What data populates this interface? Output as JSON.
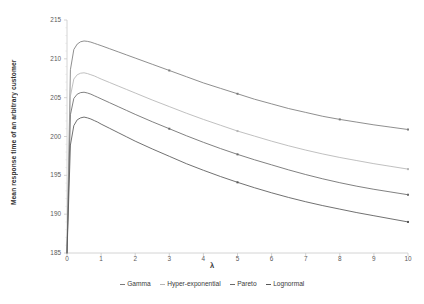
{
  "chart_data": {
    "type": "line",
    "title": "",
    "xlabel": "λ",
    "ylabel": "Mean response time of an arbitrary customer",
    "xlim": [
      0,
      10
    ],
    "ylim": [
      185,
      215
    ],
    "xticks": [
      "0",
      "1",
      "2",
      "3",
      "4",
      "5",
      "6",
      "7",
      "8",
      "9",
      "10"
    ],
    "yticks": [
      "185",
      "190",
      "195",
      "200",
      "205",
      "210",
      "215"
    ],
    "grid": false,
    "legend_position": "bottom",
    "x": [
      0,
      0.1,
      0.2,
      0.3,
      0.4,
      0.5,
      0.6,
      0.7,
      0.8,
      0.9,
      1.0,
      1.25,
      1.5,
      1.75,
      2.0,
      2.5,
      3.0,
      3.5,
      4.0,
      4.5,
      5.0,
      5.5,
      6.0,
      6.5,
      7.0,
      7.5,
      8.0,
      8.5,
      9.0,
      9.5,
      10.0
    ],
    "series": [
      {
        "name": "Gamma",
        "color": "#7b7b7b",
        "values": [
          185.0,
          208.6,
          211.2,
          211.9,
          212.2,
          212.3,
          212.25,
          212.15,
          212.0,
          211.85,
          211.7,
          211.3,
          210.9,
          210.5,
          210.1,
          209.3,
          208.5,
          207.7,
          206.9,
          206.2,
          205.5,
          204.8,
          204.2,
          203.6,
          203.1,
          202.6,
          202.2,
          201.85,
          201.5,
          201.2,
          200.9
        ]
      },
      {
        "name": "Hyper-exponential",
        "color": "#b5b5b5",
        "values": [
          185.0,
          205.2,
          207.4,
          207.95,
          208.15,
          208.2,
          208.1,
          207.95,
          207.8,
          207.6,
          207.4,
          206.95,
          206.5,
          206.05,
          205.6,
          204.7,
          203.85,
          203.0,
          202.2,
          201.45,
          200.7,
          200.05,
          199.4,
          198.8,
          198.25,
          197.75,
          197.3,
          196.9,
          196.5,
          196.15,
          195.8
        ]
      },
      {
        "name": "Pareto",
        "color": "#6a6a6a",
        "values": [
          185.0,
          202.8,
          204.9,
          205.45,
          205.65,
          205.7,
          205.6,
          205.45,
          205.25,
          205.05,
          204.85,
          204.35,
          203.85,
          203.35,
          202.85,
          201.9,
          201.0,
          200.1,
          199.25,
          198.45,
          197.7,
          197.0,
          196.35,
          195.7,
          195.1,
          194.55,
          194.05,
          193.6,
          193.2,
          192.85,
          192.5
        ]
      },
      {
        "name": "Lognormal",
        "color": "#575757",
        "values": [
          185.0,
          198.9,
          201.4,
          202.15,
          202.4,
          202.5,
          202.4,
          202.25,
          202.05,
          201.85,
          201.6,
          201.05,
          200.5,
          199.95,
          199.4,
          198.4,
          197.45,
          196.5,
          195.65,
          194.85,
          194.1,
          193.4,
          192.75,
          192.15,
          191.6,
          191.1,
          190.65,
          190.2,
          189.8,
          189.4,
          189.0
        ]
      }
    ],
    "markers": {
      "Gamma": [
        [
          3,
          208.5
        ],
        [
          5,
          205.5
        ],
        [
          8,
          202.2
        ],
        [
          10,
          200.9
        ]
      ],
      "Hyper-exponential": [
        [
          5,
          200.7
        ],
        [
          10,
          195.8
        ]
      ],
      "Pareto": [
        [
          3,
          201.0
        ],
        [
          5,
          197.7
        ],
        [
          10,
          192.5
        ]
      ],
      "Lognormal": [
        [
          5,
          194.1
        ],
        [
          10,
          189.0
        ]
      ]
    }
  },
  "axis": {
    "line_color": "#c9c9c9"
  }
}
